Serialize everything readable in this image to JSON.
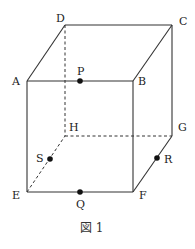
{
  "figure": {
    "caption": "図 1",
    "vertices": {
      "A": {
        "label": "A",
        "x": 27,
        "y": 81
      },
      "B": {
        "label": "B",
        "x": 133,
        "y": 81
      },
      "C": {
        "label": "C",
        "x": 172,
        "y": 25
      },
      "D": {
        "label": "D",
        "x": 65,
        "y": 25
      },
      "E": {
        "label": "E",
        "x": 27,
        "y": 192
      },
      "F": {
        "label": "F",
        "x": 134,
        "y": 192
      },
      "G": {
        "label": "G",
        "x": 173,
        "y": 136
      },
      "H": {
        "label": "H",
        "x": 65,
        "y": 135
      }
    },
    "points": {
      "P": {
        "label": "P",
        "on_edge": "AB",
        "x": 80,
        "y": 81
      },
      "Q": {
        "label": "Q",
        "on_edge": "EF",
        "x": 80,
        "y": 192
      },
      "R": {
        "label": "R",
        "on_edge": "FG",
        "x": 157,
        "y": 158
      },
      "S": {
        "label": "S",
        "on_edge": "EH",
        "x": 50,
        "y": 159
      }
    },
    "visible_edges": [
      "AB",
      "BC",
      "CD",
      "DA",
      "AE",
      "BF",
      "CG",
      "EF",
      "FG"
    ],
    "hidden_edges": [
      "DH",
      "EH",
      "HG"
    ]
  }
}
